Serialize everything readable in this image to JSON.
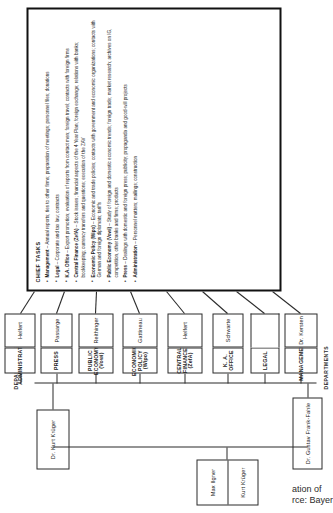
{
  "chart_title": "Organisation of IG Farben Berlin N.W.7 Office",
  "labels": {
    "departments_top": "DEPARTMENTS",
    "departments_bottom": "DEPARTMENTS"
  },
  "executives": {
    "pair_box": [
      {
        "name": "Max Ilgner"
      },
      {
        "name": "Kurt Krüger"
      }
    ],
    "second": {
      "name": "Dr. Kurt Krüger"
    },
    "third": {
      "name": "Dr. Gustav Frank-Fahle"
    }
  },
  "departments": [
    {
      "id": "management",
      "title": "MANAGEMENT",
      "sub": "",
      "head": "Dr. Kersten"
    },
    {
      "id": "legal",
      "title": "LEGAL",
      "sub": "",
      "head": ""
    },
    {
      "id": "ka-office",
      "title": "K. A. OFFICE",
      "sub": "",
      "head": "Schwarte"
    },
    {
      "id": "central-finance",
      "title": "CENTRAL FINANCE",
      "sub": "(ZefA)",
      "head": "Helfert"
    },
    {
      "id": "economic-policy",
      "title": "ECONOMIC POLICY",
      "sub": "(Wipo)",
      "head": "Gattineau"
    },
    {
      "id": "public-economy",
      "title": "PUBLIC ECONOMY",
      "sub": "(Vowi)",
      "head": "Reithinger"
    },
    {
      "id": "press",
      "title": "PRESS",
      "sub": "",
      "head": "Passarge"
    },
    {
      "id": "administration",
      "title": "ADMINISTRATION",
      "sub": "",
      "head": "Helfert"
    }
  ],
  "chief_tasks": {
    "heading": "CHIEF TASKS",
    "items": [
      {
        "lead": "Management",
        "text": "Annual reports; ties to other firms; preparation of meetings; personnel files; donations"
      },
      {
        "lead": "Legal",
        "text": "Corporate and tax law; contracts"
      },
      {
        "lead": "K.A. Office",
        "text": "Export promotion; evaluation of reports from contact men; foreign travel; contacts with foreign firms"
      },
      {
        "lead": "Central Finance (ZefA)",
        "text": "Stock issues; financial aspects of the 4 Year Plan; foreign exchange; relations with banks; bookkeeping; currency transfers and questions; execution of the ZAV"
      },
      {
        "lead": "Economic Policy (Wipo)",
        "text": "Economic and trade policies; contacts with government and economic organizations; contacts with German and foreign diplomats; tariffs"
      },
      {
        "lead": "Public Economy (Vowi)",
        "text": "Study of foreign and domestic economic trends; foreign trade; market research; archives on IG, competition, other banks and firms; products"
      },
      {
        "lead": "Press",
        "text": "Dealings with domestic and foreign press; publicity; propaganda and good-will projects"
      },
      {
        "lead": "Administration",
        "text": "Personnel matters; mailings; construction"
      }
    ]
  },
  "caption": "ation   of\nrce: Bayer",
  "colors": {
    "ink": "#2b2b2b",
    "rule": "#111111",
    "paper": "#ffffff"
  }
}
